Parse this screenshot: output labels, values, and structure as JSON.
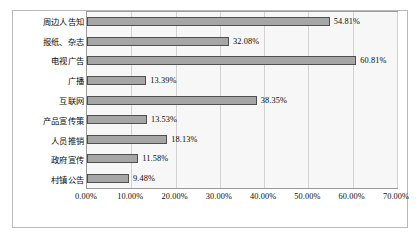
{
  "chart_data": {
    "type": "bar",
    "orientation": "horizontal",
    "title": "",
    "subtitle": "",
    "xlabel": "",
    "ylabel": "",
    "xlim": [
      0,
      70
    ],
    "xtick_labels": [
      "0.00%",
      "10.00%",
      "20.00%",
      "30.00%",
      "40.00%",
      "50.00%",
      "60.00%",
      "70.00%"
    ],
    "xtick_values": [
      0,
      10,
      20,
      30,
      40,
      50,
      60,
      70
    ],
    "grid": "vertical",
    "legend": "none",
    "categories": [
      "周边人告知",
      "报纸、杂志",
      "电视广告",
      "广播",
      "互联网",
      "产品宣传策",
      "人员推销",
      "政府宣传",
      "村镇公告"
    ],
    "values": [
      54.81,
      32.08,
      60.81,
      13.39,
      38.35,
      13.53,
      18.13,
      11.58,
      9.48
    ],
    "value_labels": [
      "54.81%",
      "32.08%",
      "60.81%",
      "13.39%",
      "38.35%",
      "13.53%",
      "18.13%",
      "11.58%",
      "9.48%"
    ],
    "colors": {
      "bar_fill": "#a6a6a6",
      "bar_border": "#4f4f4f",
      "plot_background": "#f7f7f7",
      "gridline": "#d2d2d2",
      "frame_border": "#b9b9b9",
      "text": "#0a0a0a"
    }
  }
}
